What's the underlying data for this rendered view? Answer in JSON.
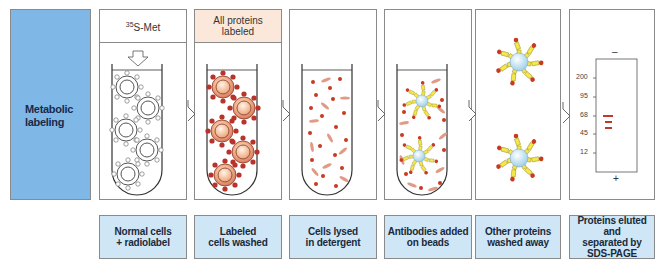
{
  "side_label": "Metabolic\nlabeling",
  "panels": [
    {
      "header_sup": "35",
      "header": "S-Met",
      "caption": "Normal cells\n+ radiolabel"
    },
    {
      "header": "All proteins\nlabeled",
      "caption": "Labeled\ncells washed"
    },
    {
      "header": "",
      "caption": "Cells lysed\nin detergent"
    },
    {
      "header": "",
      "caption": "Antibodies added\non beads"
    },
    {
      "header": "",
      "caption": "Other proteins\nwashed away"
    },
    {
      "header": "",
      "caption": "Proteins eluted and\nseparated by\nSDS-PAGE"
    }
  ],
  "gel": {
    "top_sign": "–",
    "bottom_sign": "+",
    "markers": [
      "200",
      "95",
      "68",
      "45",
      "12"
    ]
  },
  "colors": {
    "side_label_bg": "#7fb8e6",
    "caption_bg": "#cfe6f7",
    "header_peach": "#fbe8da",
    "label_red": "#c0392b",
    "antibody_yellow": "#f3e84a",
    "bead_blue": "#bfe3f5"
  }
}
